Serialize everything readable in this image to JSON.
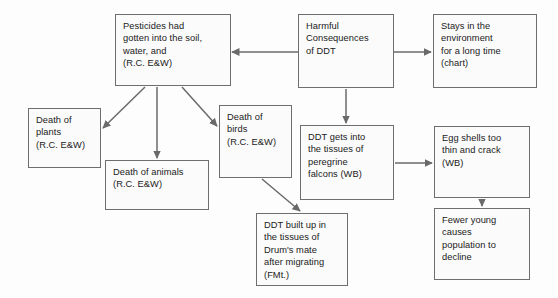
{
  "diagram": {
    "background_color": "#fdfdfd",
    "box_border_color": "#6e6e6e",
    "box_fill_color": "#fbfbfb",
    "arrow_color": "#6a6a6a",
    "nodes": [
      {
        "id": "pesticides",
        "label": "Pesticides had gotten into the soil, water, and (R.C. E&W)",
        "text": "Pesticides had\ngotten into the soil,\nwater, and\n(R.C. E&W)",
        "x": 115,
        "y": 14,
        "w": 116,
        "h": 72
      },
      {
        "id": "harmful-consequences",
        "label": "Harmful Consequences of DDT",
        "text": "Harmful\nConsequences\nof DDT",
        "x": 298,
        "y": 14,
        "w": 96,
        "h": 74
      },
      {
        "id": "stays-environment",
        "label": "Stays in the environment for a long time (chart)",
        "text": "Stays in the\nenvironment\nfor a long time\n(chart)",
        "x": 433,
        "y": 14,
        "w": 104,
        "h": 74
      },
      {
        "id": "death-plants",
        "label": "Death of plants (R.C. E&W)",
        "text": "Death of\nplants\n(R.C. E&W)",
        "x": 28,
        "y": 108,
        "w": 73,
        "h": 60
      },
      {
        "id": "death-birds",
        "label": "Death of birds (R.C. E&W)",
        "text": "Death of\nbirds\n(R.C. E&W)",
        "x": 219,
        "y": 105,
        "w": 73,
        "h": 73
      },
      {
        "id": "death-animals",
        "label": "Death of animals (R.C. E&W)",
        "text": "Death of animals\n(R.C. E&W)",
        "x": 105,
        "y": 160,
        "w": 104,
        "h": 50
      },
      {
        "id": "ddt-falcons",
        "label": "DDT gets into the tissues of peregrine falcons (WB)",
        "text": "DDT gets into\nthe tissues of\nperegrine\nfalcons (WB)",
        "x": 300,
        "y": 125,
        "w": 94,
        "h": 75
      },
      {
        "id": "egg-shells",
        "label": "Egg shells too thin and crack (WB)",
        "text": "Egg shells too\nthin and crack\n(WB)",
        "x": 434,
        "y": 126,
        "w": 96,
        "h": 72
      },
      {
        "id": "ddt-built-up",
        "label": "DDT built up in the tissues of Drum's mate after migrating (FMt.)",
        "text": "DDT built up in\nthe tissues of\nDrum's mate\nafter migrating\n(FMt.)",
        "x": 256,
        "y": 213,
        "w": 92,
        "h": 73
      },
      {
        "id": "fewer-young",
        "label": "Fewer young causes population to decline",
        "text": "Fewer young\ncauses\npopulation to\ndecline",
        "x": 434,
        "y": 208,
        "w": 96,
        "h": 72
      }
    ],
    "arrows": [
      {
        "id": "harmful-to-pesticides",
        "from": "harmful-consequences",
        "to": "pesticides",
        "points": "298,52 232,52"
      },
      {
        "id": "harmful-to-stays",
        "from": "harmful-consequences",
        "to": "stays-environment",
        "points": "394,52 431,52"
      },
      {
        "id": "harmful-to-falcons",
        "from": "harmful-consequences",
        "to": "ddt-falcons",
        "points": "346,89 346,123"
      },
      {
        "id": "pesticides-to-plants",
        "from": "pesticides",
        "to": "death-plants",
        "points": "145,87 103,128"
      },
      {
        "id": "pesticides-to-animals",
        "from": "pesticides",
        "to": "death-animals",
        "points": "157,87 157,158"
      },
      {
        "id": "pesticides-to-birds",
        "from": "pesticides",
        "to": "death-birds",
        "points": "182,87 217,126"
      },
      {
        "id": "birds-to-ddt-built-up",
        "from": "death-birds",
        "to": "ddt-built-up",
        "points": "262,179 300,211"
      },
      {
        "id": "falcons-to-egg-shells",
        "from": "ddt-falcons",
        "to": "egg-shells",
        "points": "395,163 432,163"
      },
      {
        "id": "egg-shells-to-fewer-young",
        "from": "egg-shells",
        "to": "fewer-young",
        "points": "482,199 482,206"
      }
    ]
  }
}
